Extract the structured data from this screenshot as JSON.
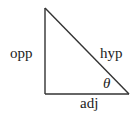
{
  "diagram": {
    "type": "right-triangle",
    "stroke_color": "#333333",
    "text_color": "#222222",
    "background": "#ffffff",
    "vertices": {
      "top": [
        45,
        8
      ],
      "right_angle": [
        45,
        94
      ],
      "acute": [
        129,
        94
      ]
    },
    "labels": {
      "opposite": "opp",
      "hypotenuse": "hyp",
      "angle": "θ",
      "adjacent": "adj"
    }
  }
}
